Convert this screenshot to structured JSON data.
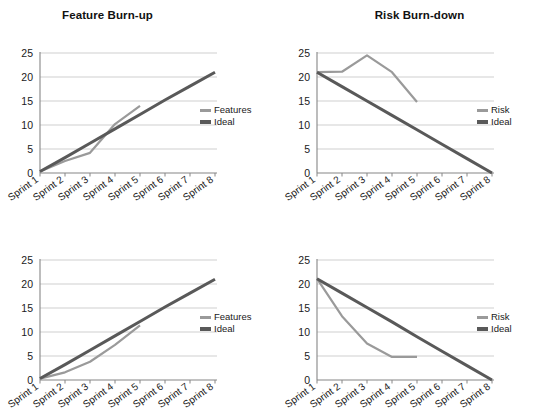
{
  "colors": {
    "actual": "#9a9a9a",
    "ideal": "#595959",
    "axis": "#868686",
    "grid": "#c9c9c9",
    "text": "#1a1a1a"
  },
  "categories": [
    "Sprint 1",
    "Sprint 2",
    "Sprint 3",
    "Sprint 4",
    "Sprint 5",
    "Sprint 6",
    "Sprint 7",
    "Sprint 8"
  ],
  "yticks": [
    "0",
    "5",
    "10",
    "15",
    "20",
    "25"
  ],
  "panels": [
    {
      "id": "feature-burn-up-top",
      "title": "Feature Burn-up",
      "legend": [
        {
          "label": "Features",
          "color": "#9a9a9a"
        },
        {
          "label": "Ideal",
          "color": "#595959"
        }
      ]
    },
    {
      "id": "risk-burn-down-top",
      "title": "Risk Burn-down",
      "legend": [
        {
          "label": "Risk",
          "color": "#9a9a9a"
        },
        {
          "label": "Ideal",
          "color": "#595959"
        }
      ]
    },
    {
      "id": "feature-burn-up-bottom",
      "title": "",
      "legend": [
        {
          "label": "Features",
          "color": "#9a9a9a"
        },
        {
          "label": "Ideal",
          "color": "#595959"
        }
      ]
    },
    {
      "id": "risk-burn-down-bottom",
      "title": "",
      "legend": [
        {
          "label": "Risk",
          "color": "#9a9a9a"
        },
        {
          "label": "Ideal",
          "color": "#595959"
        }
      ]
    }
  ],
  "chart_data": [
    {
      "type": "line",
      "id": "feature-burn-up-top",
      "title": "Feature Burn-up",
      "xlabel": "",
      "ylabel": "",
      "ylim": [
        0,
        25
      ],
      "yticks": [
        0,
        5,
        10,
        15,
        20,
        25
      ],
      "grid": true,
      "legend_position": "right",
      "categories": [
        "Sprint 1",
        "Sprint 2",
        "Sprint 3",
        "Sprint 4",
        "Sprint 5",
        "Sprint 6",
        "Sprint 7",
        "Sprint 8"
      ],
      "series": [
        {
          "name": "Features",
          "color": "#9a9a9a",
          "values": [
            0.3,
            2.5,
            4.2,
            10.2,
            14.0,
            null,
            null,
            null
          ]
        },
        {
          "name": "Ideal",
          "color": "#595959",
          "values": [
            0.3,
            3.2,
            6.2,
            9.2,
            12.2,
            15.2,
            18.1,
            21.0
          ]
        }
      ]
    },
    {
      "type": "line",
      "id": "risk-burn-down-top",
      "title": "Risk Burn-down",
      "xlabel": "",
      "ylabel": "",
      "ylim": [
        0,
        25
      ],
      "yticks": [
        0,
        5,
        10,
        15,
        20,
        25
      ],
      "grid": true,
      "legend_position": "right",
      "categories": [
        "Sprint 1",
        "Sprint 2",
        "Sprint 3",
        "Sprint 4",
        "Sprint 5",
        "Sprint 6",
        "Sprint 7",
        "Sprint 8"
      ],
      "series": [
        {
          "name": "Risk",
          "color": "#9a9a9a",
          "values": [
            21.0,
            21.1,
            24.5,
            21.0,
            14.8,
            null,
            null,
            null
          ]
        },
        {
          "name": "Ideal",
          "color": "#595959",
          "values": [
            21.0,
            18.0,
            15.0,
            12.0,
            9.0,
            6.0,
            3.0,
            0.0
          ]
        }
      ]
    },
    {
      "type": "line",
      "id": "feature-burn-up-bottom",
      "title": "",
      "xlabel": "",
      "ylabel": "",
      "ylim": [
        0,
        25
      ],
      "yticks": [
        0,
        5,
        10,
        15,
        20,
        25
      ],
      "grid": true,
      "legend_position": "right",
      "categories": [
        "Sprint 1",
        "Sprint 2",
        "Sprint 3",
        "Sprint 4",
        "Sprint 5",
        "Sprint 6",
        "Sprint 7",
        "Sprint 8"
      ],
      "series": [
        {
          "name": "Features",
          "color": "#9a9a9a",
          "values": [
            0.3,
            1.6,
            3.8,
            7.3,
            11.4,
            null,
            null,
            null
          ]
        },
        {
          "name": "Ideal",
          "color": "#595959",
          "values": [
            0.3,
            3.2,
            6.2,
            9.2,
            12.2,
            15.2,
            18.1,
            21.0
          ]
        }
      ]
    },
    {
      "type": "line",
      "id": "risk-burn-down-bottom",
      "title": "",
      "xlabel": "",
      "ylabel": "",
      "ylim": [
        0,
        25
      ],
      "yticks": [
        0,
        5,
        10,
        15,
        20,
        25
      ],
      "grid": true,
      "legend_position": "right",
      "categories": [
        "Sprint 1",
        "Sprint 2",
        "Sprint 3",
        "Sprint 4",
        "Sprint 5",
        "Sprint 6",
        "Sprint 7",
        "Sprint 8"
      ],
      "series": [
        {
          "name": "Risk",
          "color": "#9a9a9a",
          "values": [
            21.1,
            13.3,
            7.6,
            4.8,
            4.8,
            null,
            null,
            null
          ]
        },
        {
          "name": "Ideal",
          "color": "#595959",
          "values": [
            21.1,
            18.1,
            15.1,
            12.1,
            9.0,
            6.0,
            3.0,
            0.0
          ]
        }
      ]
    }
  ]
}
